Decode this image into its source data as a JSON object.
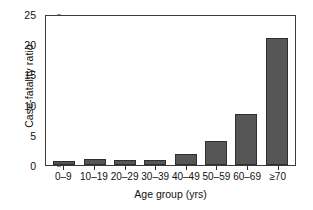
{
  "chart_data": {
    "type": "bar",
    "title": "",
    "xlabel": "Age group (yrs)",
    "ylabel": "Case-fatality ratio",
    "categories": [
      "0–9",
      "10–19",
      "20–29",
      "30–39",
      "40–49",
      "50–59",
      "60–69",
      "≥70"
    ],
    "values": [
      0.7,
      1.0,
      0.75,
      0.85,
      1.9,
      4.0,
      8.4,
      21.1
    ],
    "ylim": [
      0,
      25
    ],
    "yticks": [
      0,
      5,
      10,
      15,
      20,
      25
    ],
    "ytick_labels": [
      "0",
      "5",
      "10",
      "15",
      "20",
      "25"
    ],
    "grid": false,
    "legend": null,
    "bar_color": "#565656",
    "bar_edge_color": "#2e2e2e",
    "axis_color": "#3a3a3a",
    "background": "#ffffff"
  }
}
